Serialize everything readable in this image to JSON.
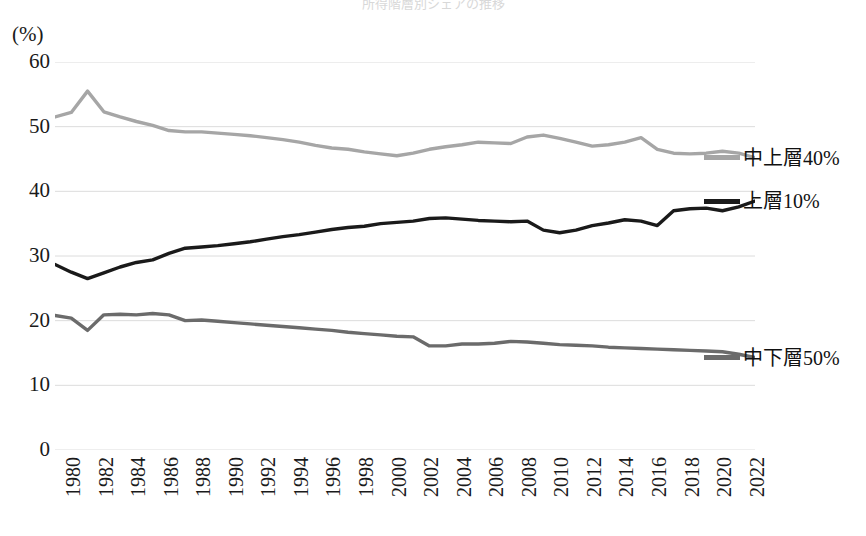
{
  "title_remnant": "所得階層別シェアの推移",
  "unit_label": "(%)",
  "axes": {
    "y_ticks": [
      "0",
      "10",
      "20",
      "30",
      "40",
      "50",
      "60"
    ],
    "x_ticks": [
      "1980",
      "1982",
      "1984",
      "1986",
      "1988",
      "1990",
      "1992",
      "1994",
      "1996",
      "1998",
      "2000",
      "2002",
      "2004",
      "2006",
      "2008",
      "2010",
      "2012",
      "2014",
      "2016",
      "2018",
      "2020",
      "2022"
    ]
  },
  "legend": {
    "items": [
      {
        "label": "上層10%",
        "color": "#1a1a1a",
        "swatch_name": "legend-swatch-top10"
      },
      {
        "label": "中上層40%",
        "color": "#a6a6a6",
        "swatch_name": "legend-swatch-upper-middle40"
      },
      {
        "label": "中下層50%",
        "color": "#6b6b6b",
        "swatch_name": "legend-swatch-lower-middle50"
      }
    ]
  },
  "chart_data": {
    "type": "line",
    "title": "所得階層別シェアの推移",
    "xlabel": "",
    "ylabel": "(%)",
    "xlim": [
      1980,
      2023
    ],
    "ylim": [
      0,
      60
    ],
    "ytick_step": 10,
    "grid": true,
    "grid_axis": "y",
    "legend_position": "right",
    "x": [
      1980,
      1981,
      1982,
      1983,
      1984,
      1985,
      1986,
      1987,
      1988,
      1989,
      1990,
      1991,
      1992,
      1993,
      1994,
      1995,
      1996,
      1997,
      1998,
      1999,
      2000,
      2001,
      2002,
      2003,
      2004,
      2005,
      2006,
      2007,
      2008,
      2009,
      2010,
      2011,
      2012,
      2013,
      2014,
      2015,
      2016,
      2017,
      2018,
      2019,
      2020,
      2021,
      2022,
      2023
    ],
    "series": [
      {
        "name": "中上層40%",
        "color": "#a6a6a6",
        "values": [
          51.5,
          52.2,
          55.5,
          52.3,
          51.5,
          50.8,
          50.2,
          49.4,
          49.2,
          49.2,
          49.0,
          48.8,
          48.6,
          48.3,
          48.0,
          47.6,
          47.1,
          46.7,
          46.5,
          46.1,
          45.8,
          45.5,
          45.9,
          46.5,
          46.9,
          47.2,
          47.6,
          47.5,
          47.4,
          48.4,
          48.7,
          48.2,
          47.6,
          47.0,
          47.2,
          47.6,
          48.3,
          46.5,
          45.9,
          45.8,
          45.9,
          46.2,
          45.9,
          45.2
        ]
      },
      {
        "name": "上層10%",
        "color": "#1a1a1a",
        "values": [
          28.7,
          27.5,
          26.5,
          27.4,
          28.3,
          29.0,
          29.4,
          30.4,
          31.2,
          31.4,
          31.6,
          31.9,
          32.2,
          32.6,
          33.0,
          33.3,
          33.7,
          34.1,
          34.4,
          34.6,
          35.0,
          35.2,
          35.4,
          35.8,
          35.9,
          35.7,
          35.5,
          35.4,
          35.3,
          35.4,
          34.0,
          33.6,
          34.0,
          34.7,
          35.1,
          35.6,
          35.4,
          34.7,
          37.0,
          37.3,
          37.4,
          37.0,
          37.6,
          38.5
        ]
      },
      {
        "name": "中下層50%",
        "color": "#6b6b6b",
        "values": [
          20.8,
          20.4,
          18.5,
          20.9,
          21.0,
          20.9,
          21.1,
          20.9,
          20.0,
          20.1,
          19.9,
          19.7,
          19.5,
          19.3,
          19.1,
          18.9,
          18.7,
          18.5,
          18.2,
          18.0,
          17.8,
          17.6,
          17.5,
          16.1,
          16.1,
          16.4,
          16.4,
          16.5,
          16.8,
          16.7,
          16.5,
          16.3,
          16.2,
          16.1,
          15.9,
          15.8,
          15.7,
          15.6,
          15.5,
          15.4,
          15.3,
          15.2,
          14.8,
          14.3
        ]
      }
    ]
  }
}
